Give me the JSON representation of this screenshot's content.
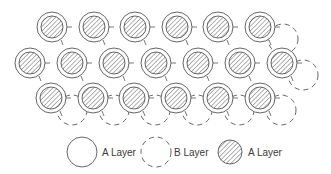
{
  "diagram": {
    "title": "",
    "colors": {
      "stroke": "#555555",
      "hatch": "#555555",
      "background": "#ffffff"
    },
    "geometry": {
      "outer_radius": 15,
      "inner_radius": 11,
      "b_radius": 15,
      "b_offset": [
        21,
        12
      ]
    },
    "a_layer_rows": [
      {
        "y": 27,
        "x": [
          52,
          94,
          135,
          177,
          218,
          260
        ]
      },
      {
        "y": 63,
        "x": [
          30,
          72,
          114,
          156,
          198,
          240,
          282
        ]
      },
      {
        "y": 98,
        "x": [
          51,
          93,
          134,
          176,
          218,
          260
        ]
      }
    ],
    "b_layer_visible": [
      {
        "x": 283,
        "y": 39
      },
      {
        "x": 303,
        "y": 75
      },
      {
        "x": 72,
        "y": 110
      },
      {
        "x": 114,
        "y": 110
      },
      {
        "x": 155,
        "y": 110
      },
      {
        "x": 197,
        "y": 110
      },
      {
        "x": 239,
        "y": 110
      },
      {
        "x": 281,
        "y": 110
      }
    ]
  },
  "legend": {
    "items": [
      {
        "symbol": "solid-circle",
        "label": "A Layer",
        "cx": 82,
        "cy": 152,
        "r": 15,
        "text_x": 102
      },
      {
        "symbol": "dashed-circle",
        "label": "B Layer",
        "cx": 156,
        "cy": 152,
        "r": 15,
        "text_x": 174
      },
      {
        "symbol": "hatched-circle",
        "label": "A Layer",
        "cx": 230,
        "cy": 152,
        "r": 12,
        "text_x": 248
      }
    ]
  }
}
